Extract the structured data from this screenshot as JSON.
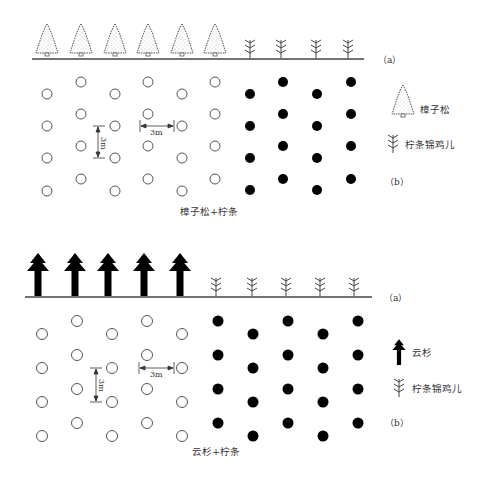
{
  "diagrams": [
    {
      "id": "camphor-pine-caragana",
      "caption": "樟子松+柠条",
      "profile_label": "（a）",
      "plan_label": "（b）",
      "tree_species": "樟子松",
      "shrub_species": "柠条锦鸡儿",
      "spacing_vertical": "3m",
      "spacing_horizontal": "3m",
      "tree_icon": "camphor-pine-icon",
      "shrub_icon": "caragana-icon",
      "profile_tree_count": 6,
      "profile_shrub_count": 4,
      "plan_open_circle_columns": 6,
      "plan_filled_circle_columns": 4,
      "rows_per_column": 4
    },
    {
      "id": "spruce-caragana",
      "caption": "云杉+柠条",
      "profile_label": "（a）",
      "plan_label": "（b）",
      "tree_species": "云杉",
      "shrub_species": "柠条锦鸡儿",
      "spacing_vertical": "3m",
      "spacing_horizontal": "3m",
      "tree_icon": "spruce-icon",
      "shrub_icon": "caragana-icon",
      "profile_tree_count": 5,
      "profile_shrub_count": 5,
      "plan_open_circle_columns": 5,
      "plan_filled_circle_columns": 5,
      "rows_per_column": 4
    }
  ],
  "colors": {
    "line": "#444444",
    "fill": "#000000",
    "text": "#333333"
  }
}
